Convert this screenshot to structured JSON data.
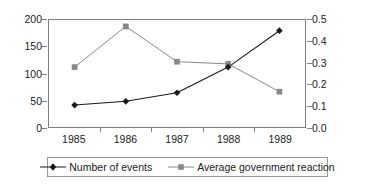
{
  "chart_data": {
    "type": "line",
    "title": "",
    "subtitle": "",
    "xlabel": "",
    "ylabel": "",
    "categories": [
      "1985",
      "1986",
      "1987",
      "1988",
      "1989"
    ],
    "x": [
      1985,
      1986,
      1987,
      1988,
      1989
    ],
    "grid": false,
    "legend_position": "bottom",
    "axes": {
      "left": {
        "label": "",
        "ylim": [
          0,
          200
        ],
        "ticks": [
          0,
          50,
          100,
          150,
          200
        ],
        "tick_labels": [
          "0",
          "50",
          "100",
          "150",
          "200"
        ]
      },
      "right": {
        "label": "",
        "ylim": [
          0.0,
          0.5
        ],
        "ticks": [
          0.0,
          0.1,
          0.2,
          0.3,
          0.4,
          0.5
        ],
        "tick_labels": [
          "0.0",
          "0.1",
          "0.2",
          "0.3",
          "0.4",
          "0.5"
        ]
      },
      "x": {
        "tick_labels": [
          "1985",
          "1986",
          "1987",
          "1988",
          "1989"
        ]
      }
    },
    "series": [
      {
        "name": "Number of events",
        "axis": "left",
        "marker": "diamond",
        "color": "#1a1a1a",
        "values": [
          41,
          48,
          64,
          112,
          180
        ]
      },
      {
        "name": "Average government reaction",
        "axis": "right",
        "marker": "square",
        "color": "#888888",
        "values": [
          0.28,
          0.47,
          0.305,
          0.295,
          0.165
        ]
      }
    ],
    "legend": [
      {
        "label": "Number of events",
        "marker": "diamond",
        "color": "#1a1a1a"
      },
      {
        "label": "Average government reaction",
        "marker": "square",
        "color": "#888888"
      }
    ],
    "colors": {
      "series_events": "#1a1a1a",
      "series_reaction": "#888888",
      "axis": "#808080",
      "text": "#1a1a1a",
      "background": "#ffffff"
    }
  }
}
